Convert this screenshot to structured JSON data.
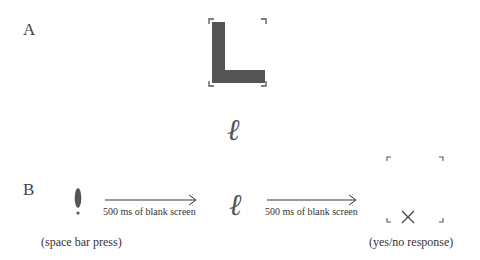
{
  "panel_a": {
    "label": "A",
    "stimulus": "L",
    "stimulus_color": "#555555"
  },
  "middle": {
    "stimulus": "ℓ"
  },
  "panel_b": {
    "label": "B",
    "fixation": "!",
    "fixation_caption": "(space bar press)",
    "interval_1": "500 ms of blank screen",
    "stimulus": "ℓ",
    "interval_2": "500 ms of blank screen",
    "response_mark": "×",
    "response_caption": "(yes/no response)"
  }
}
